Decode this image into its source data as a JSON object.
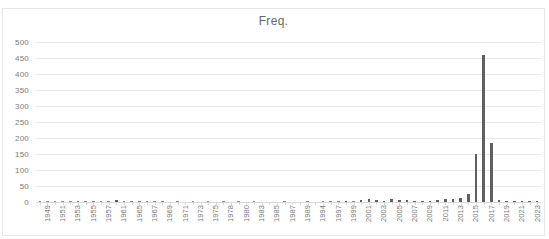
{
  "top_crop_text": "",
  "chart_data": {
    "type": "bar",
    "title": "Freq.",
    "xlabel": "",
    "ylabel": "",
    "ylim": [
      0,
      500
    ],
    "ytick_step": 50,
    "yticks": [
      0,
      50,
      100,
      150,
      200,
      250,
      300,
      350,
      400,
      450,
      500
    ],
    "ytick_labels": [
      "0",
      "50",
      "100",
      "150",
      "200",
      "250",
      "300",
      "350",
      "400",
      "450",
      "500"
    ],
    "grid": "horizontal",
    "legend": "none",
    "bar_color": "#606060",
    "label_color": "#787878",
    "title_color": "#676767",
    "xtick_label_rotation": -90,
    "xtick_label_interval": 2,
    "categories": [
      "1949",
      "1950",
      "1951",
      "1952",
      "1953",
      "1954",
      "1955",
      "1956",
      "1957",
      "1958",
      "1961",
      "1962",
      "1965",
      "1966",
      "1967",
      "1968",
      "1969",
      "1970",
      "1971",
      "1972",
      "1973",
      "1974",
      "1975",
      "1976",
      "1978",
      "1979",
      "1980",
      "1982",
      "1983",
      "1984",
      "1985",
      "1986",
      "1987",
      "1988",
      "1989",
      "1990",
      "1994",
      "1995",
      "1997",
      "1998",
      "1999",
      "2000",
      "2001",
      "2002",
      "2003",
      "2004",
      "2005",
      "2006",
      "2007",
      "2008",
      "2009",
      "2010",
      "2011",
      "2012",
      "2013",
      "2014",
      "2015",
      "2016",
      "2017",
      "2018",
      "2019",
      "2020",
      "2021",
      "2022",
      "2023",
      "2024"
    ],
    "values": [
      1,
      1,
      1,
      1,
      1,
      1,
      1,
      2,
      2,
      2,
      5,
      1,
      1,
      2,
      1,
      1,
      1,
      0,
      1,
      0,
      1,
      0,
      1,
      0,
      2,
      0,
      1,
      0,
      1,
      0,
      0,
      0,
      1,
      0,
      0,
      1,
      0,
      1,
      2,
      1,
      3,
      2,
      5,
      9,
      5,
      4,
      10,
      6,
      5,
      4,
      3,
      4,
      5,
      8,
      10,
      12,
      26,
      150,
      460,
      184,
      5,
      4,
      4,
      4,
      4,
      3
    ]
  }
}
